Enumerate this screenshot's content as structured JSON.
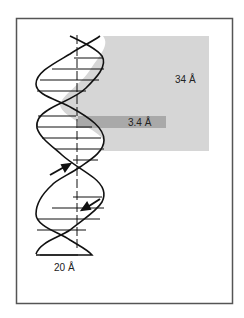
{
  "diagram": {
    "labels": {
      "pitch": "34 Å",
      "rise": "3.4 Å",
      "diameter": "20 Å"
    },
    "colors": {
      "frame": "#555555",
      "pitch_box": "#d4d4d4",
      "rise_band": "#a8a8a8",
      "strand": "#111111",
      "background": "#ffffff"
    }
  }
}
